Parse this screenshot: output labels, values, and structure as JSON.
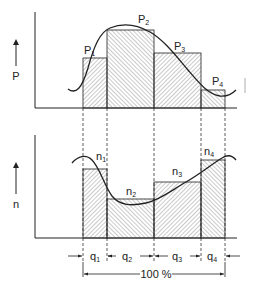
{
  "diagram": {
    "top_chart": {
      "axis_label": "P",
      "bars": [
        {
          "label": "P",
          "sub": "1"
        },
        {
          "label": "P",
          "sub": "2"
        },
        {
          "label": "P",
          "sub": "3"
        },
        {
          "label": "P",
          "sub": "4"
        }
      ]
    },
    "bottom_chart": {
      "axis_label": "n",
      "bars": [
        {
          "label": "n",
          "sub": "1"
        },
        {
          "label": "n",
          "sub": "2"
        },
        {
          "label": "n",
          "sub": "3"
        },
        {
          "label": "n",
          "sub": "4"
        }
      ]
    },
    "intervals": [
      {
        "label": "q",
        "sub": "1"
      },
      {
        "label": "q",
        "sub": "2"
      },
      {
        "label": "q",
        "sub": "3"
      },
      {
        "label": "q",
        "sub": "4"
      }
    ],
    "total_label": "100 %"
  },
  "colors": {
    "ink": "#222222",
    "hatch": "#555555",
    "background": "#ffffff"
  }
}
